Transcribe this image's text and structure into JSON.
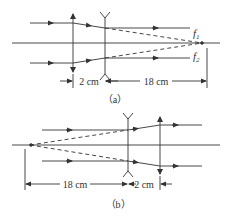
{
  "figure_a": {
    "caption": "（a）",
    "dim_left": "2 cm",
    "dim_right": "18 cm",
    "focus_label_1": "f",
    "focus_sub_1": "1",
    "focus_label_2": "f",
    "focus_sub_2": "2"
  },
  "figure_b": {
    "caption": "（b）",
    "dim_left": "18 cm",
    "dim_right": "2 cm"
  },
  "colors": {
    "line": "#333333"
  }
}
